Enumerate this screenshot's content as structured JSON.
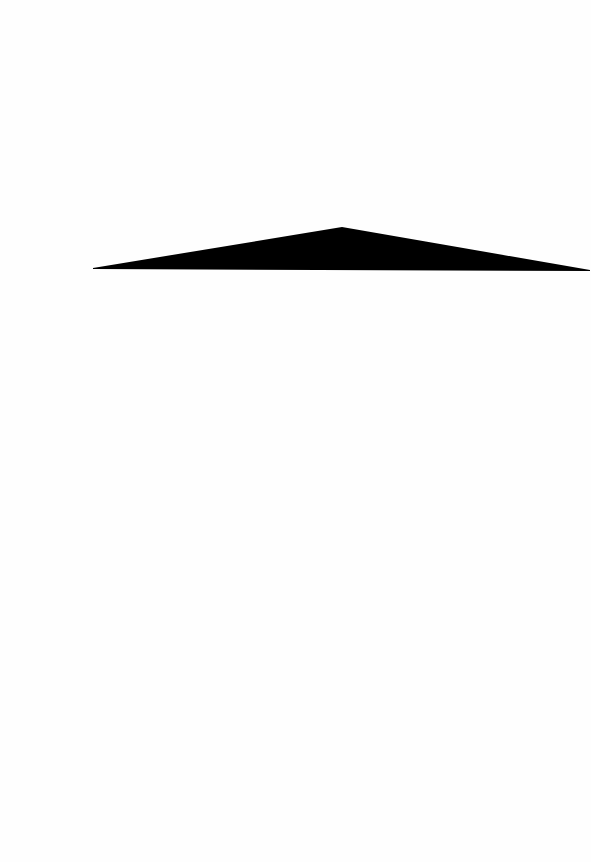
{
  "page": {
    "background": "#fefefe",
    "width": 591,
    "height": 862
  },
  "shape": {
    "type": "triangle",
    "fill": "#000000",
    "points": [
      [
        93,
        268
      ],
      [
        342,
        227
      ],
      [
        590,
        270
      ],
      [
        590,
        271
      ],
      [
        93,
        269
      ]
    ],
    "points_attr": "93,268 342,227 590,270 590,271 93,269",
    "label": ""
  }
}
